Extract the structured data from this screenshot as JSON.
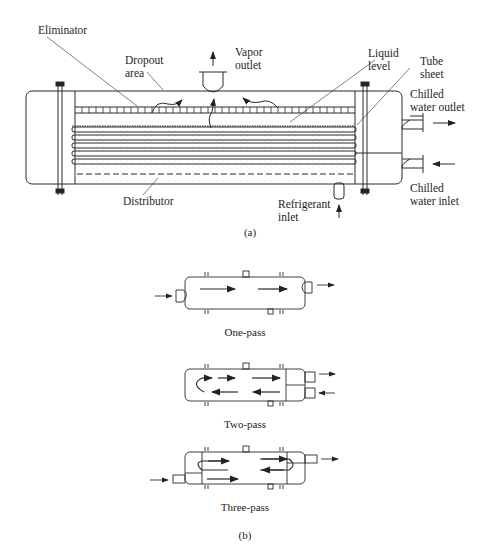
{
  "figure_a": {
    "caption": "(a)",
    "labels": {
      "eliminator": "Eliminator",
      "dropout_area": "Dropout\narea",
      "vapor_outlet": "Vapor\noutlet",
      "liquid_level": "Liquid\nlevel",
      "tube_sheet": "Tube\nsheet",
      "chilled_water_outlet": "Chilled\nwater outlet",
      "chilled_water_inlet": "Chilled\nwater inlet",
      "distributor": "Distributor",
      "refrigerant_inlet": "Refrigerant\ninlet"
    }
  },
  "figure_b": {
    "caption": "(b)",
    "variants": [
      {
        "label": "One-pass"
      },
      {
        "label": "Two-pass"
      },
      {
        "label": "Three-pass"
      }
    ]
  },
  "colors": {
    "line": "#2a2a2a",
    "background": "#ffffff"
  }
}
